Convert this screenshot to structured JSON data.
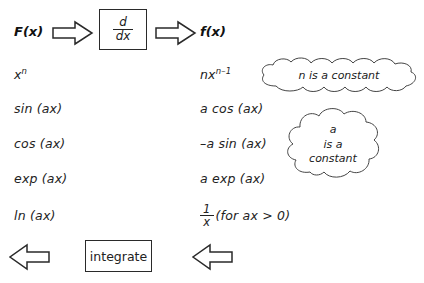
{
  "diagram": {
    "stroke_color": "#2a2a2a",
    "text_color": "#222222",
    "background_color": "#ffffff"
  },
  "header": {
    "input_label": "F(x)",
    "operator_box": {
      "numerator": "d",
      "denominator": "dx"
    },
    "output_label": "f(x)",
    "arrow_right_1": "arrow-right-icon",
    "arrow_right_2": "arrow-right-icon"
  },
  "rows": [
    {
      "input": {
        "base": "x",
        "exponent": "n",
        "text": "x n"
      },
      "output": {
        "coefficient": "nx",
        "exponent": "n–1",
        "text": "nx n–1"
      }
    },
    {
      "input": {
        "text": "sin (ax)"
      },
      "output": {
        "text": "a cos (ax)"
      }
    },
    {
      "input": {
        "text": "cos (ax)"
      },
      "output": {
        "text": "–a sin (ax)"
      }
    },
    {
      "input": {
        "text": "exp (ax)"
      },
      "output": {
        "text": "a exp (ax)"
      }
    },
    {
      "input": {
        "text": "ln (ax)"
      },
      "output": {
        "fraction": {
          "numerator": "1",
          "denominator": "x"
        },
        "condition": "(for ax > 0)",
        "text": "1/x (for ax > 0)"
      }
    }
  ],
  "callouts": [
    {
      "name": "n-is-a-constant",
      "text": "n is a constant"
    },
    {
      "name": "a-is-a-constant",
      "text": "a\nis a\nconstant"
    }
  ],
  "footer": {
    "integrate_box_label": "integrate",
    "arrow_left_1": "arrow-left-icon",
    "arrow_left_2": "arrow-left-icon"
  }
}
